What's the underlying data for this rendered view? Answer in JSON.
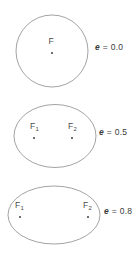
{
  "figure": {
    "background_color": "#ffffff",
    "stroke_color": "#8c8c8c",
    "text_color": "#3a3a3a",
    "dot_color": "#3f3f3f"
  },
  "conics": [
    {
      "id": "conic-1",
      "shape": "circle",
      "eccentricity_label": "e = 0.0",
      "eccentricity_symbol": "e",
      "eccentricity_equals": " = ",
      "eccentricity_value": "0.0",
      "center": {
        "cx": 52,
        "cy": 51
      },
      "radii": {
        "rx": 36,
        "ry": 36
      },
      "label_position": {
        "x": 95,
        "y": 46
      },
      "foci": [
        {
          "name": "F",
          "label": "F",
          "subscript": "",
          "label_position": {
            "x": 48.5,
            "y": 41
          },
          "dot_position": {
            "x": 51,
            "y": 53
          }
        }
      ]
    },
    {
      "id": "conic-2",
      "shape": "ellipse",
      "eccentricity_label": "e = 0.5",
      "eccentricity_symbol": "e",
      "eccentricity_equals": " = ",
      "eccentricity_value": "0.5",
      "center": {
        "cx": 55,
        "cy": 136
      },
      "radii": {
        "rx": 41,
        "ry": 31.5
      },
      "label_position": {
        "x": 99,
        "y": 131
      },
      "foci": [
        {
          "name": "F1",
          "label": "F",
          "subscript": "1",
          "label_position": {
            "x": 30,
            "y": 126
          },
          "dot_position": {
            "x": 34,
            "y": 138
          }
        },
        {
          "name": "F2",
          "label": "F",
          "subscript": "2",
          "label_position": {
            "x": 68,
            "y": 126
          },
          "dot_position": {
            "x": 72,
            "y": 138
          }
        }
      ]
    },
    {
      "id": "conic-3",
      "shape": "ellipse",
      "eccentricity_label": "e = 0.8",
      "eccentricity_symbol": "e",
      "eccentricity_equals": " = ",
      "eccentricity_value": "0.8",
      "center": {
        "cx": 54,
        "cy": 215
      },
      "radii": {
        "rx": 46,
        "ry": 29
      },
      "label_position": {
        "x": 104,
        "y": 210
      },
      "foci": [
        {
          "name": "F1",
          "label": "F",
          "subscript": "1",
          "label_position": {
            "x": 15,
            "y": 205
          },
          "dot_position": {
            "x": 19.5,
            "y": 217
          }
        },
        {
          "name": "F2",
          "label": "F",
          "subscript": "2",
          "label_position": {
            "x": 83,
            "y": 205
          },
          "dot_position": {
            "x": 87.5,
            "y": 217
          }
        }
      ]
    }
  ]
}
